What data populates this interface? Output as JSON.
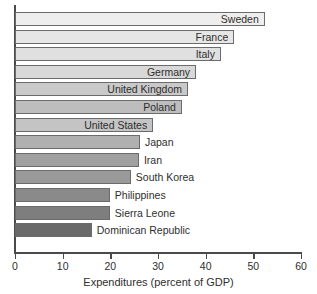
{
  "chart_data": {
    "type": "bar",
    "orientation": "horizontal",
    "title": "",
    "xlabel": "Expenditures (percent of GDP)",
    "ylabel": "",
    "xlim": [
      0,
      60
    ],
    "xticks": [
      0,
      10,
      20,
      30,
      40,
      50,
      60
    ],
    "grid": false,
    "legend": null,
    "categories": [
      "Sweden",
      "France",
      "Italy",
      "Germany",
      "United Kingdom",
      "Poland",
      "United States",
      "Japan",
      "Iran",
      "South Korea",
      "Philippines",
      "Sierra Leone",
      "Dominican Republic"
    ],
    "values": [
      52.4,
      46.0,
      43.2,
      38.0,
      36.3,
      35.0,
      29.0,
      26.2,
      26.0,
      24.3,
      19.9,
      19.9,
      16.1
    ],
    "bar_colors": [
      "#eeeeee",
      "#e6e6e6",
      "#e0e0e0",
      "#d8d8d8",
      "#c9c9c9",
      "#bdbdbd",
      "#c4c4c4",
      "#b0b0b0",
      "#a0a0a0",
      "#9a9a9a",
      "#8a8a8a",
      "#7e7e7e",
      "#6a6a6a"
    ],
    "label_placement": [
      "inside",
      "inside",
      "inside",
      "inside",
      "inside",
      "inside",
      "inside",
      "outside",
      "outside",
      "outside",
      "outside",
      "outside",
      "outside"
    ]
  },
  "axis": {
    "tick_labels": [
      "0",
      "10",
      "20",
      "30",
      "40",
      "50",
      "60"
    ],
    "x_title": "Expenditures (percent of GDP)"
  }
}
